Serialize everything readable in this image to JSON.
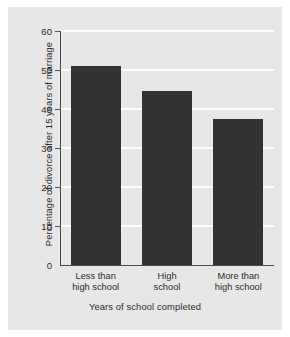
{
  "chart_data": {
    "type": "bar",
    "title": "",
    "categories": [
      "Less than\nhigh school",
      "High\nschool",
      "More than\nhigh school"
    ],
    "category_lines": [
      [
        "Less than",
        "high school"
      ],
      [
        "High",
        "school"
      ],
      [
        "More than",
        "high school"
      ]
    ],
    "values": [
      51,
      44.5,
      37.5
    ],
    "xlabel": "Years of school completed",
    "ylabel": "Percentage of divorce after 15 years of marriage",
    "ylim": [
      0,
      60
    ],
    "yticks": [
      0,
      10,
      20,
      30,
      40,
      50,
      60
    ],
    "ytick_labels": [
      "0",
      "10",
      "20",
      "30",
      "40",
      "50",
      "60"
    ],
    "grid": "horizontal",
    "legend": "none",
    "bar_color": "#333333",
    "panel_color": "#e7e7e7",
    "gridline_color": "#fdfdfd",
    "axis_color": "#4a4a4a"
  }
}
